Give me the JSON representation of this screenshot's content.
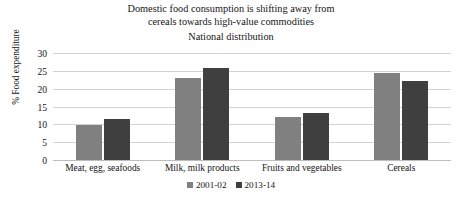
{
  "chart_data": {
    "type": "bar",
    "title": "Domestic food consumption is shifting away from cereals towards high-value commodities",
    "title_line1": "Domestic food consumption is shifting away from",
    "title_line2": "cereals towards high-value commodities",
    "subtitle": "National distribution",
    "xlabel": "",
    "ylabel": "% Food expenditure",
    "ylim": [
      0,
      30
    ],
    "ytick_labels": [
      "30",
      "25",
      "20",
      "15",
      "10",
      "5",
      "0"
    ],
    "ytick_values": [
      30,
      25,
      20,
      15,
      10,
      5,
      0
    ],
    "grid": true,
    "legend_position": "bottom",
    "categories": [
      "Meat, egg, seafoods",
      "Milk, milk products",
      "Fruits and vegetables",
      "Cereals"
    ],
    "series": [
      {
        "name": "2001-02",
        "color": "#808080",
        "values": [
          9.8,
          22.9,
          12.2,
          24.5
        ]
      },
      {
        "name": "2013-14",
        "color": "#3f3f3f",
        "values": [
          11.5,
          25.9,
          13.2,
          22.1
        ]
      }
    ]
  }
}
